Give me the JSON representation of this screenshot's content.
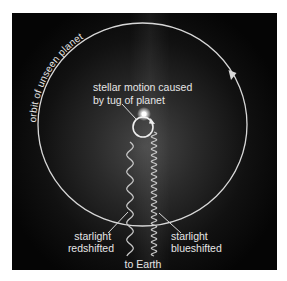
{
  "diagram": {
    "labels": {
      "orbit": "orbit of unseen planet",
      "stellar_motion_line1": "stellar motion caused",
      "stellar_motion_line2": "by tug of planet",
      "redshift_line1": "starlight",
      "redshift_line2": "redshifted",
      "blueshift_line1": "starlight",
      "blueshift_line2": "blueshifted",
      "to_earth": "to Earth"
    },
    "nodes": [
      {
        "id": "star",
        "label": "star"
      },
      {
        "id": "planet-orbit",
        "label": "orbit of unseen planet",
        "direction": "clockwise"
      },
      {
        "id": "stellar-wobble",
        "label": "stellar motion caused by tug of planet",
        "direction": "clockwise"
      },
      {
        "id": "redshifted-light",
        "label": "starlight redshifted",
        "wavelength": "long"
      },
      {
        "id": "blueshifted-light",
        "label": "starlight blueshifted",
        "wavelength": "short"
      },
      {
        "id": "earth",
        "label": "to Earth"
      }
    ],
    "edges": [
      {
        "from": "star",
        "to": "earth",
        "via": "redshifted-light"
      },
      {
        "from": "star",
        "to": "earth",
        "via": "blueshifted-light"
      }
    ],
    "colors": {
      "background": "#000000",
      "line": "#d8d8d8",
      "text": "#e6e6e6",
      "page": "#ffffff"
    }
  }
}
